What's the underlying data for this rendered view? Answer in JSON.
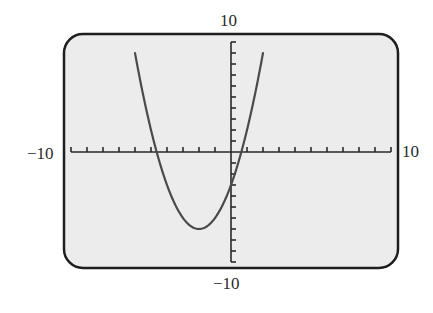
{
  "chart_data": {
    "type": "line",
    "title": "",
    "xlabel": "",
    "ylabel": "",
    "xlim": [
      -10,
      10
    ],
    "ylim": [
      -10,
      10
    ],
    "x_tick_step": 1,
    "y_tick_step": 1,
    "grid": false,
    "legend": null,
    "function": "y = x^2 + 4x - 3",
    "plotted_domain": [
      -6,
      2
    ],
    "key_points": {
      "vertex": [
        -2,
        -7
      ],
      "y_intercept": [
        0,
        -3
      ],
      "x_intercepts": [
        -4.65,
        0.65
      ]
    },
    "series": [
      {
        "name": "parabola",
        "x": [
          -6,
          -5,
          -4,
          -3,
          -2,
          -1,
          0,
          1,
          2
        ],
        "y": [
          9,
          2,
          -3,
          -6,
          -7,
          -6,
          -3,
          2,
          9
        ]
      }
    ],
    "axis_labels": {
      "x_min": "−10",
      "x_max": "10",
      "y_max": "10",
      "y_min": "−10"
    }
  },
  "colors": {
    "screen_background": "#ececec",
    "frame": "#1e1e1e",
    "axes": "#2a2a2a",
    "curve": "#4a4a4a"
  }
}
